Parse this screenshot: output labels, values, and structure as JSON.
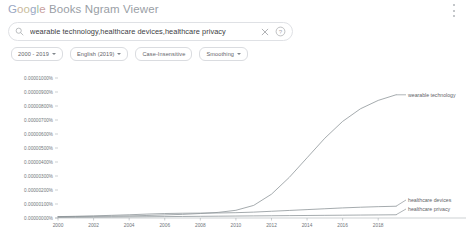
{
  "header": {
    "title_google": "Google",
    "title_rest": " Books Ngram Viewer",
    "menu_icon": "kebab-menu-icon"
  },
  "search": {
    "value": "wearable technology,healthcare devices,healthcare privacy",
    "placeholder": "Search in Google Books Ngram Viewer",
    "search_icon": "search-icon",
    "clear_icon": "close-icon",
    "help_icon": "help-circle-icon"
  },
  "filters": [
    {
      "label": "2000 - 2019",
      "has_caret": true
    },
    {
      "label": "English (2019)",
      "has_caret": true
    },
    {
      "label": "Case-Insensitive",
      "has_caret": false
    },
    {
      "label": "Smoothing",
      "has_caret": true
    }
  ],
  "chart_data": {
    "type": "line",
    "title": "",
    "xlabel": "",
    "ylabel": "",
    "grid": false,
    "legend_position": "right-inline",
    "xlim": [
      2000,
      2019
    ],
    "ylim": [
      0,
      1e-05
    ],
    "x_ticks": [
      2000,
      2002,
      2004,
      2006,
      2008,
      2010,
      2012,
      2014,
      2016,
      2018
    ],
    "y_ticks": [
      "0.00001000%",
      "0.00000900%",
      "0.00000800%",
      "0.00000700%",
      "0.00000600%",
      "0.00000500%",
      "0.00000400%",
      "0.00000300%",
      "0.00000200%",
      "0.00000100%",
      "0.00000000%"
    ],
    "y_tick_values": [
      1e-05,
      9e-06,
      8e-06,
      7e-06,
      6e-06,
      5e-06,
      4e-06,
      3e-06,
      2e-06,
      1e-06,
      0.0
    ],
    "x": [
      2000,
      2001,
      2002,
      2003,
      2004,
      2005,
      2006,
      2007,
      2008,
      2009,
      2010,
      2011,
      2012,
      2013,
      2014,
      2015,
      2016,
      2017,
      2018,
      2019
    ],
    "series": [
      {
        "name": "wearable technology",
        "color": "#8e9599",
        "values": [
          1e-07,
          1.1e-07,
          1.2e-07,
          1.3e-07,
          1.5e-07,
          1.8e-07,
          2.2e-07,
          2.6e-07,
          3.2e-07,
          4e-07,
          5.5e-07,
          9e-07,
          1.7e-06,
          2.9e-06,
          4.3e-06,
          5.7e-06,
          6.9e-06,
          7.8e-06,
          8.4e-06,
          8.8e-06
        ]
      },
      {
        "name": "healthcare devices",
        "color": "#8e9599",
        "values": [
          1e-07,
          1.2e-07,
          1.5e-07,
          1.9e-07,
          2.3e-07,
          2.8e-07,
          3.2e-07,
          3.4e-07,
          3.5e-07,
          3.6e-07,
          3.8e-07,
          4.2e-07,
          4.8e-07,
          5.4e-07,
          6e-07,
          6.6e-07,
          7.2e-07,
          7.7e-07,
          8.1e-07,
          8.4e-07
        ]
      },
      {
        "name": "healthcare privacy",
        "color": "#8e9599",
        "values": [
          4e-08,
          5e-08,
          6e-08,
          7e-08,
          8e-08,
          9e-08,
          1e-07,
          1.1e-07,
          1.2e-07,
          1.3e-07,
          1.4e-07,
          1.5e-07,
          1.6e-07,
          1.7e-07,
          1.8e-07,
          1.9e-07,
          2e-07,
          2.1e-07,
          2.2e-07,
          2.3e-07
        ]
      }
    ]
  }
}
